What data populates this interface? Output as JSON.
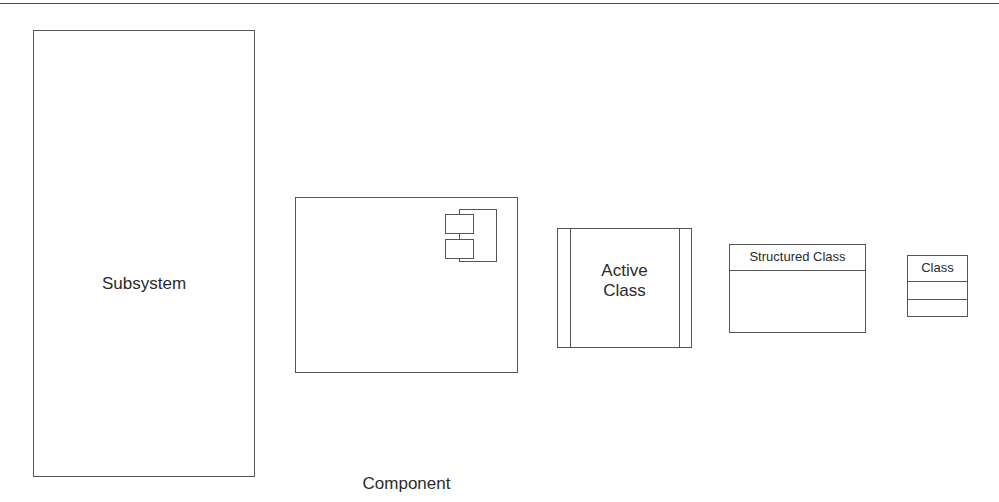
{
  "diagram": {
    "background_color": "#ffffff",
    "stroke_color": "#555555",
    "text_color": "#2b2b2b",
    "width": 999,
    "height": 502,
    "top_rule_color": "#4a4a4a"
  },
  "shapes": {
    "subsystem": {
      "label": "Subsystem",
      "kind": "subsystem",
      "x": 33,
      "y": 30,
      "width": 222,
      "height": 447
    },
    "component": {
      "label": "Component",
      "kind": "component",
      "x": 295,
      "y": 197,
      "width": 223,
      "height": 176,
      "icon": "uml-component-icon"
    },
    "active_class": {
      "label": "Active\nClass",
      "line1": "Active",
      "line2": "Class",
      "kind": "active-class",
      "x": 557,
      "y": 228,
      "width": 135,
      "height": 120
    },
    "structured_class": {
      "label": "Structured Class",
      "kind": "structured-class",
      "x": 729,
      "y": 244,
      "width": 137,
      "height": 89,
      "compartments": 2
    },
    "class": {
      "label": "Class",
      "kind": "class",
      "x": 907,
      "y": 255,
      "width": 61,
      "height": 62,
      "compartments": 3
    }
  }
}
